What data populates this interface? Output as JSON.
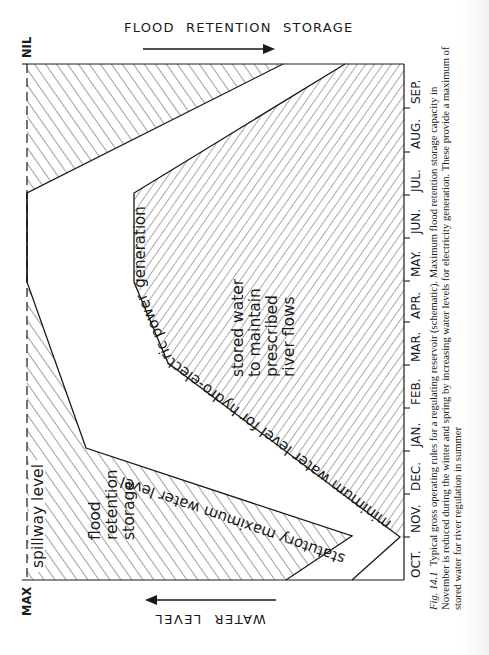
{
  "header": {
    "top_axis_label": "FLOOD RETENTION STORAGE",
    "bottom_axis_label": "WATER LEVEL"
  },
  "level_markers": {
    "nil": "NIL",
    "max": "MAX"
  },
  "months": [
    "OCT.",
    "NOV.",
    "DEC.",
    "JAN.",
    "FEB.",
    "MAR.",
    "APR.",
    "MAY.",
    "JUN.",
    "JUL.",
    "AUG.",
    "SEP."
  ],
  "regions": {
    "spillway_label": "spillway level",
    "flood_retention_label": [
      "flood",
      "retention",
      "storage"
    ],
    "statutory_max_label": "statutory maximum water level",
    "minimum_level_label": "minimum water level for hydro-electric power generation",
    "stored_water_label": [
      "stored water",
      "to maintain",
      "prescribed",
      "river flows"
    ]
  },
  "caption": {
    "figure_number": "Fig. 14.1",
    "text": "Typical gross operating rules for a regulating reservoir (schematic). Maximum flood retention storage capacity in November is reduced during the winter and spring by increasing water levels for electricity generation. These provide a maximum of stored water for river regulation in summer"
  },
  "colors": {
    "ink": "#1a1a1a",
    "paper": "#ffffff"
  }
}
